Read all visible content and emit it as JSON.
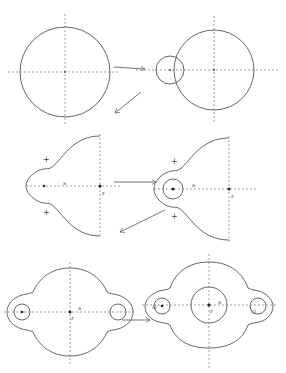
{
  "diagram": {
    "panels": [
      {
        "id": "unit-circle",
        "row": 1,
        "col": 1,
        "labels": []
      },
      {
        "id": "two-circles",
        "row": 1,
        "col": 2,
        "labels": []
      },
      {
        "id": "cusp-domain",
        "row": 2,
        "col": 1,
        "labels": {
          "plus_top": "+",
          "plus_bottom": "+",
          "center_label": "a",
          "right_label": "z"
        }
      },
      {
        "id": "cusp-domain-with-hole",
        "row": 2,
        "col": 2,
        "labels": {
          "plus_top": "+",
          "plus_bottom": "+",
          "center_label": "a",
          "right_label": "z"
        }
      },
      {
        "id": "two-lobe-domain",
        "row": 3,
        "col": 1,
        "labels": {
          "center_label": "a",
          "below_label": "z"
        }
      },
      {
        "id": "two-lobe-domain-with-holes",
        "row": 3,
        "col": 2,
        "labels": {
          "center_label": "a",
          "below_label": "z",
          "left_label": "r1",
          "right_label": "r2"
        }
      }
    ],
    "arrows": [
      {
        "from": "unit-circle",
        "to": "two-circles",
        "direction": "right"
      },
      {
        "from": "two-circles",
        "to": "cusp-domain",
        "direction": "down-left"
      },
      {
        "from": "cusp-domain",
        "to": "cusp-domain-with-hole",
        "direction": "right"
      },
      {
        "from": "cusp-domain-with-hole",
        "to": "two-lobe-domain",
        "direction": "down-left"
      },
      {
        "from": "two-lobe-domain",
        "to": "two-lobe-domain-with-holes",
        "direction": "right"
      }
    ],
    "colors": {
      "stroke": "#555555",
      "background": "#ffffff"
    }
  }
}
